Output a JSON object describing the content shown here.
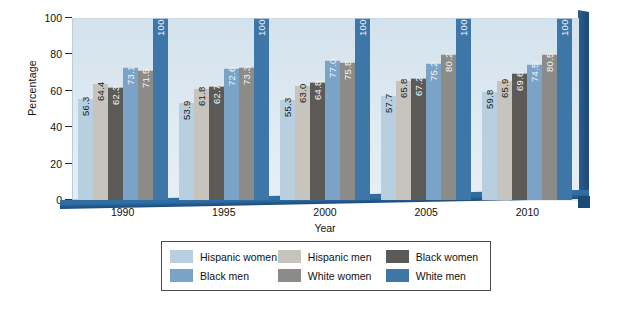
{
  "chart_data": {
    "type": "bar",
    "title": "",
    "xlabel": "Year",
    "ylabel": "Percentage",
    "categories": [
      "1990",
      "1995",
      "2000",
      "2005",
      "2010"
    ],
    "ylim": [
      0,
      100
    ],
    "yticks": [
      "0",
      "20",
      "40",
      "60",
      "80",
      "100"
    ],
    "grid": false,
    "legend_position": "bottom",
    "series": [
      {
        "name": "Hispanic women",
        "color": "#b8cfe0",
        "label_color": "dark",
        "values": [
          56.3,
          53.9,
          55.3,
          57.7,
          59.8
        ]
      },
      {
        "name": "Hispanic men",
        "color": "#c6c4bd",
        "label_color": "dark",
        "values": [
          64.4,
          61.8,
          63.0,
          65.8,
          65.9
        ]
      },
      {
        "name": "Black women",
        "color": "#5c5a57",
        "label_color": "light",
        "values": [
          62.3,
          62.7,
          64.8,
          67.2,
          69.6
        ]
      },
      {
        "name": "Black men",
        "color": "#7ba3c8",
        "label_color": "light",
        "values": [
          73.1,
          72.6,
          77.0,
          75.2,
          74.5
        ]
      },
      {
        "name": "White women",
        "color": "#8d8b88",
        "label_color": "light",
        "values": [
          71.5,
          73.3,
          75.8,
          80.2,
          80.5
        ]
      },
      {
        "name": "White men",
        "color": "#3f76a8",
        "label_color": "light",
        "values": [
          100,
          100,
          100,
          100,
          100
        ]
      }
    ],
    "value_labels": {
      "1990": [
        "56.3",
        "64.4",
        "62.3",
        "73.1",
        "71.5",
        "100"
      ],
      "1995": [
        "53.9",
        "61.8",
        "62.7",
        "72.6",
        "73.3",
        "100"
      ],
      "2000": [
        "55.3",
        "63.0",
        "64.8",
        "77.0",
        "75.8",
        "100"
      ],
      "2005": [
        "57.7",
        "65.8",
        "67.2",
        "75.2",
        "80.2",
        "100"
      ],
      "2010": [
        "59.8",
        "65.9",
        "69.6",
        "74.5",
        "80.5",
        "100"
      ]
    }
  },
  "legend": {
    "rows": [
      [
        {
          "name": "Hispanic women",
          "color": "#b8cfe0"
        },
        {
          "name": "Hispanic men",
          "color": "#c6c4bd"
        },
        {
          "name": "Black women",
          "color": "#5c5a57"
        }
      ],
      [
        {
          "name": "Black men",
          "color": "#7ba3c8"
        },
        {
          "name": "White women",
          "color": "#8d8b88"
        },
        {
          "name": "White men",
          "color": "#3f76a8"
        }
      ]
    ]
  }
}
